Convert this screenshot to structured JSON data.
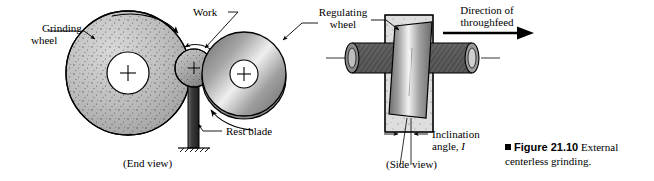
{
  "figure": {
    "caption_marker": "square-bullet",
    "caption_number": "Figure 21.10",
    "caption_text": "External centerless grinding.",
    "background_color": "#ffffff",
    "ink_color": "#000000"
  },
  "end_view": {
    "view_label": "(End view)",
    "labels": {
      "grinding_wheel": "Grinding\nwheel",
      "work": "Work",
      "rest_blade": "Rest blade"
    },
    "parts": {
      "grinding_wheel": {
        "name": "grinding-wheel",
        "cx": 128,
        "cy": 73,
        "r": 62,
        "hub_r": 21,
        "fill": "#b9b9b9",
        "texture": "speckled-grit"
      },
      "workpiece": {
        "name": "workpiece",
        "cx": 195,
        "cy": 67,
        "r": 19,
        "fill": "#a8a8a8",
        "texture": "speckled-grit"
      },
      "regulating_wheel": {
        "name": "regulating-wheel",
        "cx": 244,
        "cy": 74,
        "r": 42,
        "hub_r": 14,
        "fill": "#9a9a9a",
        "texture": "metallic-gradient"
      },
      "rest_blade": {
        "name": "rest-blade",
        "x": 188,
        "y": 86,
        "w": 11,
        "h": 62,
        "fill": "#4a4a4a",
        "ground_symbol": "hatched"
      }
    },
    "rotation_arrows": [
      {
        "name": "grinding-wheel-rotation-arrow",
        "direction": "clockwise"
      },
      {
        "name": "workpiece-rotation-arrow",
        "direction": "counterclockwise"
      },
      {
        "name": "regulating-wheel-rotation-arrow",
        "direction": "counterclockwise"
      }
    ]
  },
  "side_view": {
    "view_label": "(Side view)",
    "labels": {
      "regulating_wheel": "Regulating\nwheel",
      "direction_of_throughfeed": "Direction of\nthroughfeed",
      "inclination_angle_line1": "Inclination",
      "inclination_angle_line2": "angle, ",
      "inclination_angle_symbol": "I"
    },
    "parts": {
      "grinding_wheel_block": {
        "name": "grinding-wheel-block",
        "x": 385,
        "y": 15,
        "w": 48,
        "h": 117,
        "fill": "#d8d8d8",
        "texture": "speckled-grit"
      },
      "regulating_wheel_block": {
        "name": "regulating-wheel-block",
        "fill": "#8f8f8f",
        "texture": "metallic-gradient",
        "tilted": true
      },
      "workpiece_cylinder": {
        "name": "workpiece-cylinder",
        "x": 345,
        "y": 44,
        "w": 135,
        "h": 29,
        "fill": "#5e5e5e",
        "texture": "cross-hatch",
        "end_caps": "elliptical"
      }
    },
    "throughfeed_arrow": {
      "name": "throughfeed-arrow",
      "direction": "right"
    }
  }
}
